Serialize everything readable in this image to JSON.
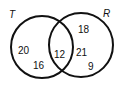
{
  "venn": {
    "sets": [
      {
        "label": "T",
        "cx": 42,
        "cy": 47,
        "r": 31
      },
      {
        "label": "R",
        "cx": 81,
        "cy": 45,
        "r": 32
      }
    ],
    "regions": {
      "t_only": [
        "20",
        "16"
      ],
      "both": "12",
      "r_only": [
        "18",
        "21",
        "9"
      ]
    },
    "stroke_color": "#111111"
  }
}
